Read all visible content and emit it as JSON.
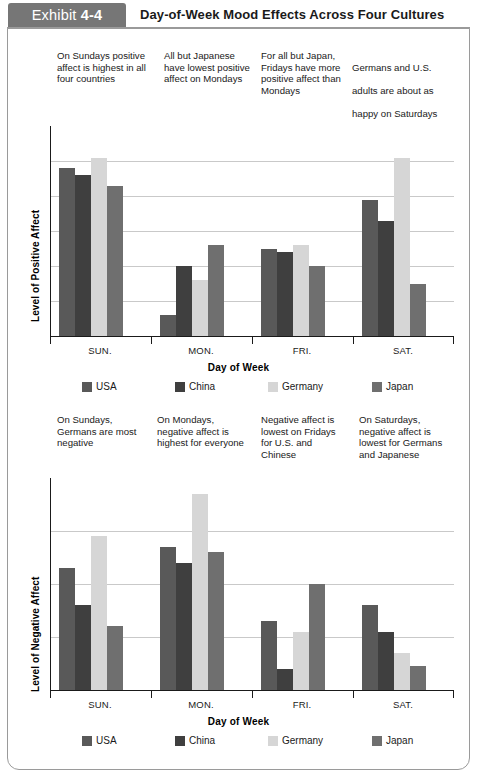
{
  "header": {
    "exhibit_prefix": "Exhibit ",
    "exhibit_number": "4-4",
    "title": "Day-of-Week Mood Effects Across Four Cultures",
    "tab_color": "#767676"
  },
  "series_colors": {
    "USA": "#595959",
    "China": "#3f3f3f",
    "Germany": "#d6d6d6",
    "Japan": "#6f6f6f"
  },
  "legend": [
    {
      "label": "USA",
      "color": "#595959"
    },
    {
      "label": "China",
      "color": "#3f3f3f"
    },
    {
      "label": "Germany",
      "color": "#d6d6d6"
    },
    {
      "label": "Japan",
      "color": "#6f6f6f"
    }
  ],
  "top_annotations": [
    "On Sundays positive\naffect is highest in all\nfour countries",
    "All but Japanese\nhave lowest positive\naffect on Mondays",
    "For all but Japan,\nFridays have more\npositive affect than\nMondays"
  ],
  "top_annotation_4": {
    "line1": "Germans and U.S.",
    "line2": "adults are about as",
    "line3": "happy on Saturdays",
    "line4": "as on Sundays;",
    "line5": "Japanese are the",
    "line6_italic": "least happy"
  },
  "bottom_annotations": [
    "On Sundays,\nGermans are most\nnegative",
    "On Mondays,\nnegative affect is\nhighest for everyone",
    "Negative affect is\nlowest on Fridays\nfor U.S. and\nChinese",
    "On Saturdays,\nnegative affect is\nlowest for Germans\nand Japanese"
  ],
  "chart_data": [
    {
      "type": "bar",
      "title": "Level of Positive Affect by Day of Week",
      "ylabel": "Level of Positive Affect",
      "xlabel": "Day of Week",
      "categories": [
        "SUN.",
        "MON.",
        "FRI.",
        "SAT."
      ],
      "ylim": [
        0,
        6
      ],
      "grid": true,
      "gridlines": [
        1,
        2,
        3,
        4,
        5
      ],
      "legend_position": "bottom",
      "series": [
        {
          "name": "USA",
          "color": "#595959",
          "values": [
            4.8,
            0.6,
            2.5,
            3.9
          ]
        },
        {
          "name": "China",
          "color": "#3f3f3f",
          "values": [
            4.6,
            2.0,
            2.4,
            3.3
          ]
        },
        {
          "name": "Germany",
          "color": "#d6d6d6",
          "values": [
            5.1,
            1.6,
            2.6,
            5.1
          ]
        },
        {
          "name": "Japan",
          "color": "#6f6f6f",
          "values": [
            4.3,
            2.6,
            2.0,
            1.5
          ]
        }
      ]
    },
    {
      "type": "bar",
      "title": "Level of Negative Affect by Day of Week",
      "ylabel": "Level of Negative Affect",
      "xlabel": "Day of Week",
      "categories": [
        "SUN.",
        "MON.",
        "FRI.",
        "SAT."
      ],
      "ylim": [
        0,
        4
      ],
      "grid": true,
      "gridlines": [
        1,
        2,
        3
      ],
      "legend_position": "bottom",
      "series": [
        {
          "name": "USA",
          "color": "#595959",
          "values": [
            2.3,
            2.7,
            1.3,
            1.6
          ]
        },
        {
          "name": "China",
          "color": "#3f3f3f",
          "values": [
            1.6,
            2.4,
            0.4,
            1.1
          ]
        },
        {
          "name": "Germany",
          "color": "#d6d6d6",
          "values": [
            2.9,
            3.7,
            1.1,
            0.7
          ]
        },
        {
          "name": "Japan",
          "color": "#6f6f6f",
          "values": [
            1.2,
            2.6,
            2.0,
            0.45
          ]
        }
      ]
    }
  ]
}
